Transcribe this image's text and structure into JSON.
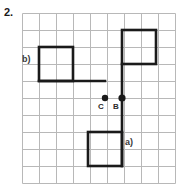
{
  "problem": {
    "number": "2."
  },
  "grid": {
    "origin_x": 22,
    "origin_y": 13,
    "cell": 17,
    "cols": 9,
    "rows": 10,
    "line_color": "#b8b8b8",
    "line_width": 1,
    "border_color": "#b8b8b8"
  },
  "figure": {
    "stroke_color": "#1a1a1a",
    "stroke_width": 2.6,
    "shapes": [
      {
        "name": "square-b",
        "type": "rect",
        "x": 39,
        "y": 47,
        "width": 34,
        "height": 34
      },
      {
        "name": "connector-horizontal",
        "type": "line",
        "x1": 39,
        "y1": 81,
        "x2": 105,
        "y2": 81
      },
      {
        "name": "square-top-right",
        "type": "rect",
        "x": 122,
        "y": 30,
        "width": 34,
        "height": 34
      },
      {
        "name": "vertical-spine",
        "type": "line",
        "x1": 122,
        "y1": 64,
        "x2": 122,
        "y2": 166
      },
      {
        "name": "square-a",
        "type": "rect",
        "x": 88,
        "y": 132,
        "width": 34,
        "height": 34
      }
    ],
    "points": [
      {
        "name": "point-c",
        "label": "C",
        "cx": 105,
        "cy": 98,
        "r": 3.2,
        "label_x": 98,
        "label_y": 102
      },
      {
        "name": "point-b",
        "label": "B",
        "cx": 122,
        "cy": 98,
        "r": 3.6,
        "label_x": 113,
        "label_y": 102
      }
    ],
    "labels": [
      {
        "name": "label-b",
        "text": "b)",
        "x": 22,
        "y": 54
      },
      {
        "name": "label-a",
        "text": "a)",
        "x": 125,
        "y": 137
      }
    ]
  }
}
